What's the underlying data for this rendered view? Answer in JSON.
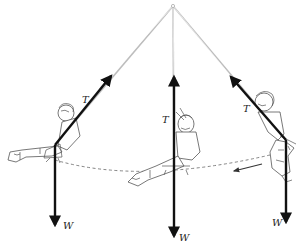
{
  "diagram": {
    "title": "",
    "pivot": {
      "x": 173,
      "y": 6
    },
    "positions": [
      {
        "id": "left",
        "tension_label": "T",
        "weight_label": "W",
        "seat": {
          "x": 55,
          "y": 145
        },
        "tension_tip": {
          "x": 113,
          "y": 73
        },
        "weight_tip": {
          "x": 55,
          "y": 228
        }
      },
      {
        "id": "middle",
        "tension_label": "T",
        "weight_label": "W",
        "seat": {
          "x": 174,
          "y": 160
        },
        "tension_tip": {
          "x": 174,
          "y": 74
        },
        "weight_tip": {
          "x": 174,
          "y": 239
        }
      },
      {
        "id": "right",
        "tension_label": "T",
        "weight_label": "W",
        "seat": {
          "x": 286,
          "y": 140
        },
        "tension_tip": {
          "x": 229,
          "y": 74
        },
        "weight_tip": {
          "x": 286,
          "y": 225
        }
      }
    ],
    "motion_arrow": {
      "direction": "leftward",
      "from": {
        "x": 262,
        "y": 164
      },
      "to": {
        "x": 233,
        "y": 171
      }
    },
    "path": "dashed arc through swing seat positions",
    "colors": {
      "force": "#111111",
      "rope": "#bdbdbd",
      "arc": "#666666"
    }
  }
}
